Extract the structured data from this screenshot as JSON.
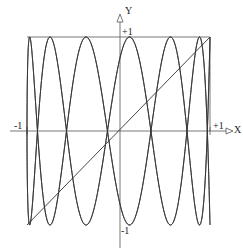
{
  "chart_data": {
    "type": "line",
    "title": "",
    "xlabel": "X",
    "ylabel": "Y",
    "xlim": [
      -1,
      1
    ],
    "ylim": [
      -1,
      1
    ],
    "tick_labels": {
      "x_min": "-1",
      "x_max": "+1",
      "y_max": "+1",
      "y_min": "-1"
    },
    "grid": false,
    "legend": null,
    "series": [
      {
        "name": "diagonal y = x",
        "kind": "line",
        "points": [
          [
            -1,
            -1
          ],
          [
            1,
            1
          ]
        ]
      },
      {
        "name": "oscillating curve family x = cos(t), y = cos(a t)",
        "kind": "parametric",
        "a": 6.5,
        "t_range": [
          0,
          12.566
        ]
      }
    ],
    "frame": {
      "top_line_y": 1,
      "right_line_x": 1,
      "left_line_x": -1
    }
  },
  "labels": {
    "x_axis": "X",
    "y_axis": "Y",
    "x_min": "-1",
    "x_max": "+1",
    "y_max": "+1",
    "y_min": "-1"
  },
  "colors": {
    "ink": "#333333",
    "axis": "#555555"
  }
}
